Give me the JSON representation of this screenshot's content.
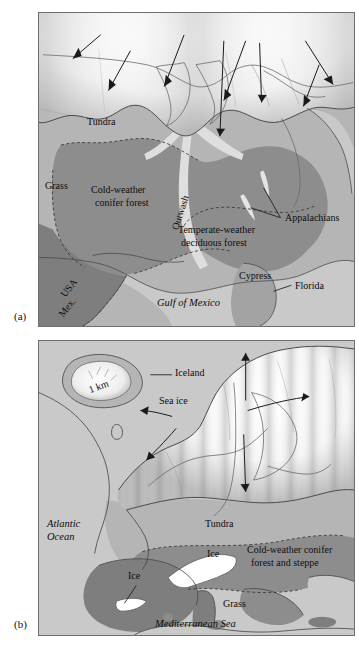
{
  "figure": {
    "panels": [
      {
        "id": "a",
        "tag": "(a)",
        "caption_region": "North America at the Last Glacial Maximum",
        "labels": [
          {
            "name": "tundra",
            "text": "Tundra",
            "style": "plain"
          },
          {
            "name": "grass",
            "text": "Grass",
            "style": "plain"
          },
          {
            "name": "cold-conifer-1",
            "text": "Cold-weather",
            "style": "plain"
          },
          {
            "name": "cold-conifer-2",
            "text": "conifer forest",
            "style": "plain"
          },
          {
            "name": "outwash",
            "text": "Outwash",
            "style": "rotated"
          },
          {
            "name": "temperate-1",
            "text": "Temperate-weather",
            "style": "plain"
          },
          {
            "name": "temperate-2",
            "text": "deciduous forest",
            "style": "plain"
          },
          {
            "name": "appalachians",
            "text": "Appalachians",
            "style": "plain"
          },
          {
            "name": "cypress",
            "text": "Cypress",
            "style": "plain"
          },
          {
            "name": "florida",
            "text": "Florida",
            "style": "plain"
          },
          {
            "name": "usa",
            "text": "USA",
            "style": "rotated"
          },
          {
            "name": "mex",
            "text": "Mex.",
            "style": "rotated"
          },
          {
            "name": "gulf-of-mexico",
            "text": "Gulf of Mexico",
            "style": "italic"
          }
        ]
      },
      {
        "id": "b",
        "tag": "(b)",
        "caption_region": "Europe and the North Atlantic at the Last Glacial Maximum",
        "labels": [
          {
            "name": "one-km",
            "text": "1 km",
            "style": "rotated"
          },
          {
            "name": "iceland",
            "text": "Iceland",
            "style": "plain"
          },
          {
            "name": "sea-ice",
            "text": "Sea ice",
            "style": "plain"
          },
          {
            "name": "atlantic-1",
            "text": "Atlantic",
            "style": "italic"
          },
          {
            "name": "atlantic-2",
            "text": "Ocean",
            "style": "italic"
          },
          {
            "name": "tundra-b",
            "text": "Tundra",
            "style": "plain"
          },
          {
            "name": "ice-alps",
            "text": "Ice",
            "style": "plain"
          },
          {
            "name": "ice-pyrenees",
            "text": "Ice",
            "style": "plain"
          },
          {
            "name": "cold-conifer-b-1",
            "text": "Cold-weather conifer",
            "style": "plain"
          },
          {
            "name": "cold-conifer-b-2",
            "text": "forest and steppe",
            "style": "plain"
          },
          {
            "name": "grass-b",
            "text": "Grass",
            "style": "plain"
          },
          {
            "name": "mediterranean-sea",
            "text": "Mediterranean Sea",
            "style": "italic"
          }
        ]
      }
    ]
  },
  "colors": {
    "page_background": "#ffffff",
    "panel_border": "#6e6e6e",
    "ocean_light": "#c9c9c9",
    "tundra_mid": "#b5b5b5",
    "grass_mid": "#b0b0b0",
    "conifer_dark": "#8d8d8d",
    "deciduous_dark": "#8d8d8d",
    "land_dark": "#7e7e7e",
    "ice_white": "#ffffff",
    "ice_shadow": "#a8a8a8",
    "outline": "#4a4a4a",
    "text": "#111111",
    "arrow": "#1a1a1a"
  },
  "icons": {
    "ice_flow_arrow": "arrow-icon",
    "leader_line": "leader-line-icon"
  }
}
